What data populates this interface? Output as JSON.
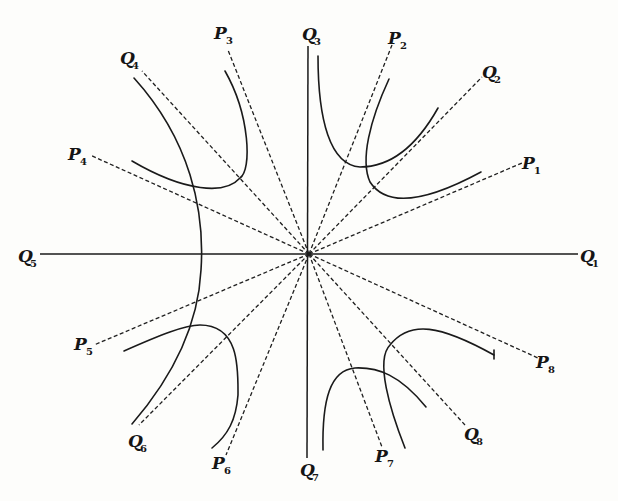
{
  "diagram": {
    "center": {
      "x": 309,
      "y": 254
    },
    "axes": [
      {
        "id": "Q1-Q5",
        "x1": 40,
        "y1": 254,
        "x2": 578,
        "y2": 254
      },
      {
        "id": "Q3-Q7",
        "x1": 308,
        "y1": 46,
        "x2": 307,
        "y2": 458
      }
    ],
    "dashed_rays": [
      {
        "id": "P1",
        "x2": 522,
        "y2": 163
      },
      {
        "id": "Q2",
        "x2": 482,
        "y2": 77
      },
      {
        "id": "P2",
        "x2": 392,
        "y2": 45
      },
      {
        "id": "P3",
        "x2": 228,
        "y2": 50
      },
      {
        "id": "Q4",
        "x2": 142,
        "y2": 71
      },
      {
        "id": "P4",
        "x2": 90,
        "y2": 155
      },
      {
        "id": "P5",
        "x2": 94,
        "y2": 345
      },
      {
        "id": "Q6",
        "x2": 139,
        "y2": 425
      },
      {
        "id": "P6",
        "x2": 226,
        "y2": 455
      },
      {
        "id": "P7",
        "x2": 382,
        "y2": 447
      },
      {
        "id": "Q8",
        "x2": 465,
        "y2": 425
      },
      {
        "id": "P8",
        "x2": 538,
        "y2": 358
      }
    ],
    "curves": [
      {
        "id": "big-left-arc",
        "d": "M 134 78 C 190 140, 205 210, 201 270 C 198 330, 170 380, 132 424"
      },
      {
        "id": "upper-left-branch",
        "d": "M 225 71 C 250 115, 252 170, 240 178 C 225 195, 185 192, 132 161"
      },
      {
        "id": "upper-right-a",
        "d": "M 318 56 C 318 120, 330 165, 360 167 C 395 167, 420 140, 438 108"
      },
      {
        "id": "upper-right-b",
        "d": "M 389 79 C 370 120, 360 160, 370 182 C 385 205, 420 205, 481 172"
      },
      {
        "id": "lower-left-branch",
        "d": "M 124 351 C 160 335, 185 325, 200 325 C 240 325, 238 370, 238 395 C 236 420, 228 435, 212 448"
      },
      {
        "id": "lower-right-a",
        "d": "M 323 450 C 322 400, 330 370, 355 368 C 378 367, 400 375, 426 407"
      },
      {
        "id": "lower-right-b",
        "d": "M 405 448 C 390 410, 375 360, 390 345 C 410 320, 440 325, 494 355"
      }
    ],
    "tick_marks": [
      {
        "id": "p8-branch-end",
        "x1": 494,
        "y1": 350,
        "x2": 494,
        "y2": 359
      }
    ],
    "labels": [
      {
        "id": "Q1",
        "letter": "Q",
        "sub": "1",
        "x": 580,
        "y": 262
      },
      {
        "id": "Q2",
        "letter": "Q",
        "sub": "2",
        "x": 482,
        "y": 78
      },
      {
        "id": "P1",
        "letter": "P",
        "sub": "1",
        "x": 522,
        "y": 169
      },
      {
        "id": "Q3",
        "letter": "Q",
        "sub": "3",
        "x": 302,
        "y": 40
      },
      {
        "id": "P2",
        "letter": "P",
        "sub": "2",
        "x": 388,
        "y": 44
      },
      {
        "id": "P3",
        "letter": "P",
        "sub": "3",
        "x": 214,
        "y": 39
      },
      {
        "id": "Q4",
        "letter": "Q",
        "sub": "4",
        "x": 120,
        "y": 64
      },
      {
        "id": "P4",
        "letter": "P",
        "sub": "4",
        "x": 68,
        "y": 160
      },
      {
        "id": "Q5",
        "letter": "Q",
        "sub": "5",
        "x": 18,
        "y": 262
      },
      {
        "id": "P5",
        "letter": "P",
        "sub": "5",
        "x": 74,
        "y": 350
      },
      {
        "id": "Q6",
        "letter": "Q",
        "sub": "6",
        "x": 128,
        "y": 447
      },
      {
        "id": "P6",
        "letter": "P",
        "sub": "6",
        "x": 212,
        "y": 469
      },
      {
        "id": "Q7",
        "letter": "Q",
        "sub": "7",
        "x": 300,
        "y": 476
      },
      {
        "id": "P7",
        "letter": "P",
        "sub": "7",
        "x": 375,
        "y": 462
      },
      {
        "id": "Q8",
        "letter": "Q",
        "sub": "8",
        "x": 464,
        "y": 440
      },
      {
        "id": "P8",
        "letter": "P",
        "sub": "8",
        "x": 536,
        "y": 368
      }
    ]
  }
}
